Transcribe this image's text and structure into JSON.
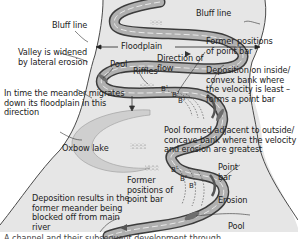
{
  "diagram": {
    "colors": {
      "background": "#ffffff",
      "valley_floor": "#e6e6e6",
      "valley_edge": "#4a4a4a",
      "river_channel": "#a8a8a8",
      "river_bank": "#3c3c3c",
      "oxbow_lake": "#cfcfcf",
      "point_bar": "#5a5a5a",
      "text": "#222222"
    },
    "labels": {
      "bluff_line_left": "Bluff line",
      "bluff_line_right": "Bluff line",
      "floodplain": "Floodplain",
      "pool_top": "Pool",
      "riffles": "Riffles",
      "direction_of_flow": "Direction of flow",
      "former_positions_top": "Former positions of point bar",
      "deposition_inside": "Deposition on inside/ convex bank where the velocity is least –forms a point bar",
      "valley_widened": "Valley is widened by lateral erosion",
      "meander_migrates": "In time the meander migrates down its floodplain in this direction",
      "pool_formed": "Pool formed adjacent to outside/ concave bank where the velocity and erosion are greatest",
      "oxbow_lake": "Oxbow lake",
      "former_positions_bottom": "Former positions of point bar",
      "point_bar": "Point bar",
      "erosion": "Erosion",
      "deposition_blocked": "Deposition results in the former meander being blocked off from main river",
      "pool_bottom": "Pool"
    },
    "point_bar_markers": {
      "top": [
        "B",
        "B",
        "B"
      ],
      "bottom": [
        "B",
        "B",
        "B"
      ],
      "top_subscripts": [
        "1",
        "2",
        "3"
      ],
      "bottom_subscripts": [
        "1",
        "2",
        "3"
      ]
    },
    "caption_cutoff": "A channel and their subsequent development through ..."
  }
}
